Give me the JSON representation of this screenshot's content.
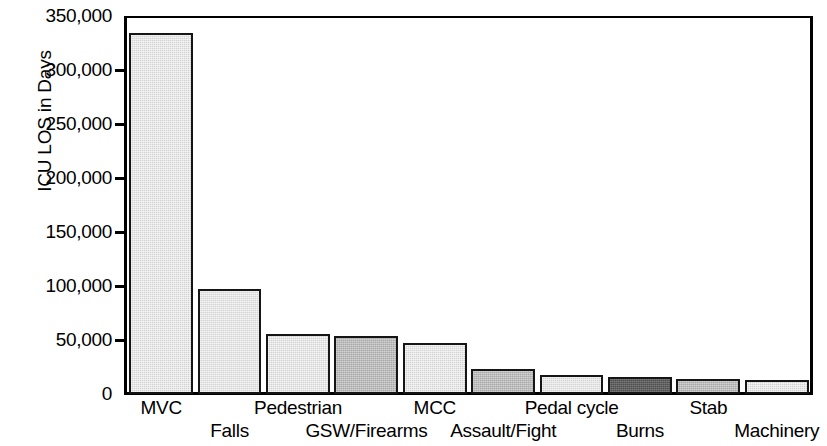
{
  "chart_data": {
    "type": "bar",
    "title": "",
    "xlabel": "",
    "ylabel": "ICU LOS in Days",
    "ylim": [
      0,
      350000
    ],
    "ytick_step": 50000,
    "grid": false,
    "legend": "none",
    "categories": [
      "MVC",
      "Falls",
      "Pedestrian",
      "GSW/Firearms",
      "MCC",
      "Assault/Fight",
      "Pedal cycle",
      "Burns",
      "Stab",
      "Machinery"
    ],
    "values": [
      334000,
      97000,
      56000,
      54000,
      47000,
      23000,
      18000,
      16000,
      14000,
      13000
    ],
    "bar_shades": [
      "light",
      "light",
      "light",
      "medium",
      "light",
      "medium",
      "light",
      "dark",
      "medium",
      "light"
    ],
    "ytick_labels": [
      "350,000",
      "300,000",
      "250,000",
      "200,000",
      "150,000",
      "100,000",
      "50,000",
      "0"
    ],
    "ytick_values": [
      350000,
      300000,
      250000,
      200000,
      150000,
      100000,
      50000,
      0
    ],
    "colors": {
      "light": "#d3d3d3",
      "medium": "#a9a9a9",
      "dark": "#4f4f4f",
      "outline": "#151515",
      "axis": "#000000",
      "background": "#ffffff"
    },
    "label_rows": [
      0,
      1,
      0,
      1,
      0,
      1,
      0,
      1,
      0,
      1
    ]
  }
}
